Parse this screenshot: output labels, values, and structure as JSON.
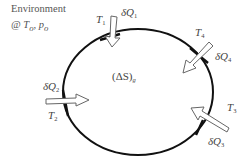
{
  "environment": {
    "title": "Environment",
    "at": "@ ",
    "T": "T",
    "T_sub": "o",
    "sep": ", ",
    "p": "p",
    "p_sub": "o"
  },
  "system": {
    "label_open": "(ΔS)",
    "label_sub": "g"
  },
  "heat_transfers": [
    {
      "temp": "T",
      "temp_sub": "1",
      "heat": "δQ",
      "heat_sub": "1",
      "direction": "inward"
    },
    {
      "temp": "T",
      "temp_sub": "2",
      "heat": "δQ",
      "heat_sub": "2",
      "direction": "inward"
    },
    {
      "temp": "T",
      "temp_sub": "3",
      "heat": "δQ",
      "heat_sub": "3",
      "direction": "inward"
    },
    {
      "temp": "T",
      "temp_sub": "4",
      "heat": "δQ",
      "heat_sub": "4",
      "direction": "inward"
    }
  ]
}
